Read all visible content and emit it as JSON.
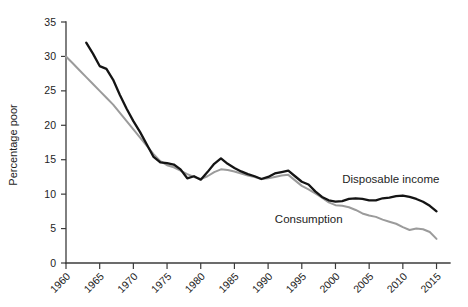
{
  "chart_data": {
    "type": "line",
    "title": "",
    "xlabel": "",
    "ylabel": "Percentage poor",
    "xlim": [
      1960,
      2017
    ],
    "ylim": [
      0,
      35
    ],
    "grid": false,
    "legend_position": "inline-annotations",
    "x_ticks": [
      "1960",
      "1965",
      "1970",
      "1975",
      "1980",
      "1985",
      "1990",
      "1995",
      "2000",
      "2005",
      "2010",
      "2015"
    ],
    "y_ticks": [
      "0",
      "5",
      "10",
      "15",
      "20",
      "25",
      "30",
      "35"
    ],
    "series": [
      {
        "name": "Disposable income",
        "color": "#141414",
        "label_x": 2001,
        "label_y": 11.6,
        "x": [
          1963,
          1964,
          1965,
          1966,
          1967,
          1968,
          1969,
          1970,
          1971,
          1972,
          1973,
          1974,
          1975,
          1976,
          1977,
          1978,
          1979,
          1980,
          1981,
          1982,
          1983,
          1984,
          1985,
          1986,
          1987,
          1988,
          1989,
          1990,
          1991,
          1992,
          1993,
          1994,
          1995,
          1996,
          1997,
          1998,
          1999,
          2000,
          2001,
          2002,
          2003,
          2004,
          2005,
          2006,
          2007,
          2008,
          2009,
          2010,
          2011,
          2012,
          2013,
          2014,
          2015
        ],
        "values": [
          32.0,
          30.4,
          28.6,
          28.2,
          26.6,
          24.4,
          22.4,
          20.6,
          19.0,
          17.2,
          15.4,
          14.6,
          14.5,
          14.3,
          13.6,
          12.3,
          12.6,
          12.1,
          13.2,
          14.4,
          15.2,
          14.4,
          13.8,
          13.3,
          12.9,
          12.6,
          12.2,
          12.5,
          13.0,
          13.2,
          13.4,
          12.6,
          11.8,
          11.4,
          10.4,
          9.6,
          9.1,
          8.9,
          9.0,
          9.3,
          9.4,
          9.3,
          9.1,
          9.1,
          9.4,
          9.5,
          9.7,
          9.8,
          9.6,
          9.3,
          8.9,
          8.3,
          7.5
        ]
      },
      {
        "name": "Consumption",
        "color": "#9b9b9b",
        "label_x": 1991,
        "label_y": 5.8,
        "x": [
          1960,
          1961,
          1962,
          1963,
          1964,
          1965,
          1966,
          1967,
          1968,
          1969,
          1970,
          1971,
          1972,
          1973,
          1974,
          1975,
          1976,
          1977,
          1978,
          1979,
          1980,
          1981,
          1982,
          1983,
          1984,
          1985,
          1986,
          1987,
          1988,
          1989,
          1990,
          1991,
          1992,
          1993,
          1994,
          1995,
          1996,
          1997,
          1998,
          1999,
          2000,
          2001,
          2002,
          2003,
          2004,
          2005,
          2006,
          2007,
          2008,
          2009,
          2010,
          2011,
          2012,
          2013,
          2014,
          2015
        ],
        "values": [
          30.0,
          29.0,
          28.0,
          27.0,
          26.0,
          25.0,
          24.0,
          23.0,
          21.8,
          20.6,
          19.4,
          18.2,
          17.0,
          15.8,
          14.8,
          14.2,
          13.9,
          13.4,
          12.9,
          12.5,
          12.2,
          12.6,
          13.2,
          13.6,
          13.5,
          13.3,
          13.0,
          12.7,
          12.5,
          12.2,
          12.3,
          12.5,
          12.7,
          12.8,
          12.0,
          11.2,
          10.7,
          10.1,
          9.5,
          8.8,
          8.4,
          8.3,
          8.1,
          7.7,
          7.2,
          6.9,
          6.7,
          6.3,
          6.0,
          5.7,
          5.2,
          4.8,
          5.0,
          4.9,
          4.5,
          3.5
        ]
      }
    ]
  }
}
